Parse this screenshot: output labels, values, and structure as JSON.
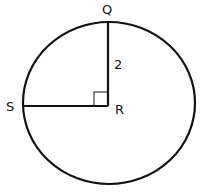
{
  "diagram": {
    "type": "geometry-circle",
    "points": {
      "Q": {
        "label": "Q"
      },
      "R": {
        "label": "R"
      },
      "S": {
        "label": "S"
      }
    },
    "segments": [
      {
        "from": "R",
        "to": "Q",
        "length_label": "2"
      },
      {
        "from": "R",
        "to": "S",
        "length_label": ""
      }
    ],
    "right_angle_at": "R",
    "colors": {
      "stroke": "#111111",
      "background": "#ffffff"
    }
  }
}
